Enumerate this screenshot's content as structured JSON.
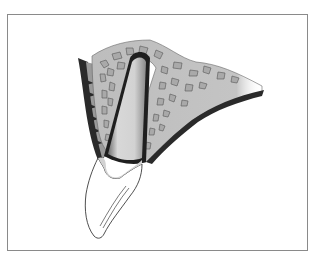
{
  "figure": {
    "labels": [],
    "colors": {
      "frame": "#8a8a8a",
      "bone_fill": "#c8c8c8",
      "trabecula_fill": "#a9a9a9",
      "trabecula_stroke": "#555555",
      "cortical_dark": "#2a2a2a",
      "root_fill": "#d6d6d6",
      "crown_fill": "#ffffff",
      "outline": "#222222"
    }
  }
}
